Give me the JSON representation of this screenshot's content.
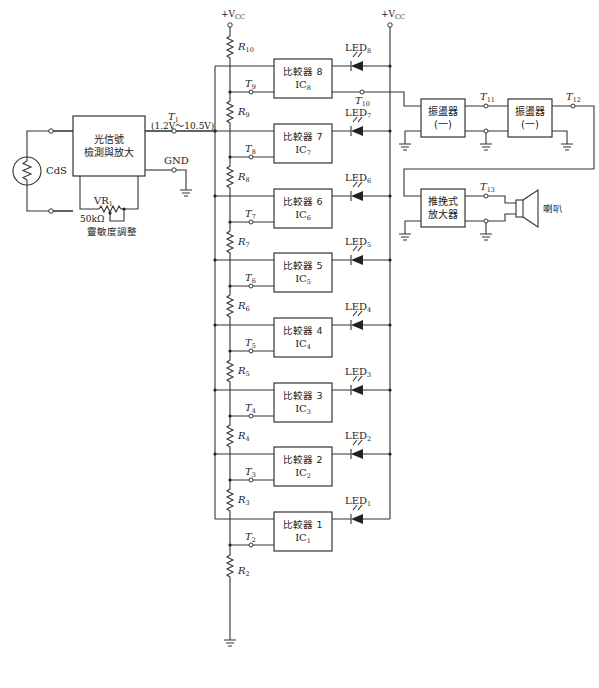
{
  "diagram": {
    "type": "circuit-schematic",
    "supply": {
      "left_label": "+V",
      "left_sub": "CC",
      "right_label": "+V",
      "right_sub": "CC"
    },
    "sensor": {
      "label": "CdS"
    },
    "detector": {
      "line1": "光信號",
      "line2": "檢測與放大"
    },
    "detector_out": {
      "terminal": "T",
      "terminal_sub": "1",
      "range": "(1.2V～10.5V)"
    },
    "gnd_label": "GND",
    "pot": {
      "label": "VR",
      "sub": "1",
      "value": "50kΩ",
      "caption": "靈敏度調整"
    },
    "comparators": [
      {
        "name": "比較器 8",
        "ic": "IC",
        "ic_sub": "8",
        "tap": "T",
        "tap_sub": "9",
        "led": "LED",
        "led_sub": "8",
        "r_above": "R",
        "r_above_sub": "10"
      },
      {
        "name": "比較器 7",
        "ic": "IC",
        "ic_sub": "7",
        "tap": "T",
        "tap_sub": "8",
        "led": "LED",
        "led_sub": "7",
        "r_above": "R",
        "r_above_sub": "9"
      },
      {
        "name": "比較器 6",
        "ic": "IC",
        "ic_sub": "6",
        "tap": "T",
        "tap_sub": "7",
        "led": "LED",
        "led_sub": "6",
        "r_above": "R",
        "r_above_sub": "8"
      },
      {
        "name": "比較器 5",
        "ic": "IC",
        "ic_sub": "5",
        "tap": "T",
        "tap_sub": "6",
        "led": "LED",
        "led_sub": "5",
        "r_above": "R",
        "r_above_sub": "7"
      },
      {
        "name": "比較器 4",
        "ic": "IC",
        "ic_sub": "4",
        "tap": "T",
        "tap_sub": "5",
        "led": "LED",
        "led_sub": "4",
        "r_above": "R",
        "r_above_sub": "6"
      },
      {
        "name": "比較器 3",
        "ic": "IC",
        "ic_sub": "3",
        "tap": "T",
        "tap_sub": "4",
        "led": "LED",
        "led_sub": "3",
        "r_above": "R",
        "r_above_sub": "5"
      },
      {
        "name": "比較器 2",
        "ic": "IC",
        "ic_sub": "2",
        "tap": "T",
        "tap_sub": "3",
        "led": "LED",
        "led_sub": "2",
        "r_above": "R",
        "r_above_sub": "4"
      },
      {
        "name": "比較器 1",
        "ic": "IC",
        "ic_sub": "1",
        "tap": "T",
        "tap_sub": "2",
        "led": "LED",
        "led_sub": "1",
        "r_above": "R",
        "r_above_sub": "3"
      }
    ],
    "bottom_resistor": {
      "label": "R",
      "sub": "2"
    },
    "ic8_out": {
      "label": "T",
      "sub": "10"
    },
    "osc1": {
      "line1": "振盪器",
      "line2": "(一)"
    },
    "osc_mid": {
      "label": "T",
      "sub": "11"
    },
    "osc2": {
      "line1": "振盪器",
      "line2": "(一)"
    },
    "osc_out": {
      "label": "T",
      "sub": "12"
    },
    "amp": {
      "line1": "推挽式",
      "line2": "放大器"
    },
    "amp_out": {
      "label": "T",
      "sub": "13"
    },
    "speaker": {
      "label": "喇叭"
    }
  }
}
